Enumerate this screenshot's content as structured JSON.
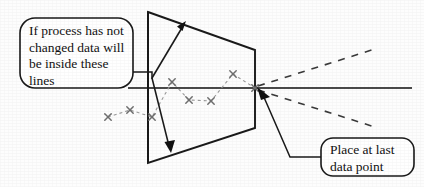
{
  "figure": {
    "background_color": "#fdfdfd",
    "line_color": "#1a1a1a",
    "data_series_color": "#8a8a8a",
    "callout_border_color": "#1a1a1a"
  },
  "callouts": [
    {
      "id": "left",
      "name": "process-unchanged-callout",
      "lines": [
        "If process has not",
        "changed data will",
        "be inside these",
        "lines"
      ],
      "text": "If process has not\nchanged data will\nbe inside these\nlines",
      "box": {
        "x": 20,
        "y": 18,
        "width": 113,
        "height": 70,
        "radius": 14
      }
    },
    {
      "id": "right",
      "name": "place-at-last-data-point-callout",
      "lines": [
        "Place at last",
        "data point"
      ],
      "text": "Place at last\ndata point",
      "box": {
        "x": 321,
        "y": 138,
        "width": 93,
        "height": 38,
        "radius": 12
      }
    }
  ],
  "axis": {
    "name": "baseline-axis",
    "x1": 128,
    "y1": 88,
    "x2": 412,
    "y2": 88
  },
  "funnel": {
    "name": "funnel-limit-shape",
    "description": "Trapezoid narrowing left-to-right to the vertex at the last data point",
    "points": [
      {
        "x": 148,
        "y": 12
      },
      {
        "x": 255,
        "y": 50
      },
      {
        "x": 255,
        "y": 128
      },
      {
        "x": 148,
        "y": 163
      }
    ],
    "vertex": {
      "x": 256,
      "y": 88
    }
  },
  "projection_lines": [
    {
      "name": "upper-projection-dashed",
      "x1": 258,
      "y1": 86,
      "x2": 378,
      "y2": 48
    },
    {
      "name": "lower-projection-dashed",
      "x1": 258,
      "y1": 90,
      "x2": 378,
      "y2": 128
    }
  ],
  "spread_arrow": {
    "name": "spread-double-arrow",
    "pivot": {
      "x": 152,
      "y": 78
    },
    "tip_up": {
      "x": 186,
      "y": 21
    },
    "tip_down": {
      "x": 171,
      "y": 152
    }
  },
  "leaders": [
    {
      "name": "left-callout-leader",
      "points": [
        [
          133,
          72
        ],
        [
          152,
          72
        ],
        [
          152,
          78
        ]
      ]
    },
    {
      "name": "right-callout-leader",
      "points": [
        [
          321,
          157
        ],
        [
          290,
          157
        ],
        [
          262,
          94
        ]
      ],
      "arrow_at": {
        "x": 257,
        "y": 88
      }
    }
  ],
  "chart_data": {
    "type": "scatter",
    "title": "",
    "xlabel": "",
    "ylabel": "",
    "marker": "x",
    "connected": true,
    "note": "Pixel coordinates of the plotted data points; y is inverted (smaller y = higher value)",
    "points": [
      {
        "x": 108,
        "y": 117
      },
      {
        "x": 130,
        "y": 110
      },
      {
        "x": 152,
        "y": 117
      },
      {
        "x": 172,
        "y": 82
      },
      {
        "x": 189,
        "y": 100
      },
      {
        "x": 211,
        "y": 101
      },
      {
        "x": 233,
        "y": 74
      },
      {
        "x": 255,
        "y": 88
      }
    ]
  }
}
